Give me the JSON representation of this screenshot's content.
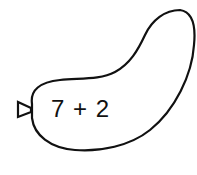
{
  "balloon": {
    "expression": "7 + 2",
    "stroke_color": "#111111",
    "fill_color": "#ffffff"
  }
}
